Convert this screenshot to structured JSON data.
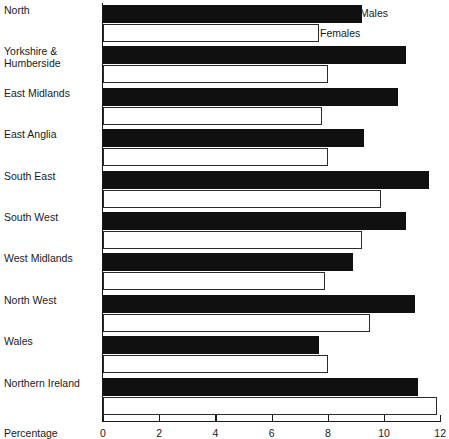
{
  "chart_data": {
    "type": "bar",
    "orientation": "horizontal",
    "title": "",
    "xlabel": "Percentage",
    "ylabel": "",
    "xlim": [
      0,
      12
    ],
    "xticks": [
      0,
      2,
      4,
      6,
      8,
      10,
      12
    ],
    "xtick_labels": [
      "0",
      "2",
      "4",
      "6",
      "8",
      "10",
      "12"
    ],
    "grid": false,
    "legend_position": "top-right-inline",
    "categories": [
      "North",
      "Yorkshire & Humberside",
      "East Midlands",
      "East Anglia",
      "South East",
      "South West",
      "West Midlands",
      "North West",
      "Wales",
      "Northern Ireland"
    ],
    "series": [
      {
        "name": "Males",
        "color": "#101010",
        "values": [
          9.2,
          10.8,
          10.5,
          9.3,
          11.6,
          10.8,
          8.9,
          11.1,
          7.7,
          11.2
        ]
      },
      {
        "name": "Females",
        "color": "#ffffff",
        "values": [
          7.7,
          8.0,
          7.8,
          8.0,
          9.9,
          9.2,
          7.9,
          9.5,
          8.0,
          11.9
        ]
      }
    ]
  },
  "labels": {
    "rows": [
      {
        "line1": "North",
        "line2": ""
      },
      {
        "line1": "Yorkshire &",
        "line2": "Humberside"
      },
      {
        "line1": "East Midlands",
        "line2": ""
      },
      {
        "line1": "East Anglia",
        "line2": ""
      },
      {
        "line1": "South East",
        "line2": ""
      },
      {
        "line1": "South West",
        "line2": ""
      },
      {
        "line1": "West Midlands",
        "line2": ""
      },
      {
        "line1": "North West",
        "line2": ""
      },
      {
        "line1": "Wales",
        "line2": ""
      },
      {
        "line1": "Northern Ireland",
        "line2": ""
      }
    ]
  },
  "legend": {
    "males": "Males",
    "females": "Females"
  },
  "axis": {
    "title": "Percentage",
    "ticks": [
      "0",
      "2",
      "4",
      "6",
      "8",
      "10",
      "12"
    ]
  }
}
